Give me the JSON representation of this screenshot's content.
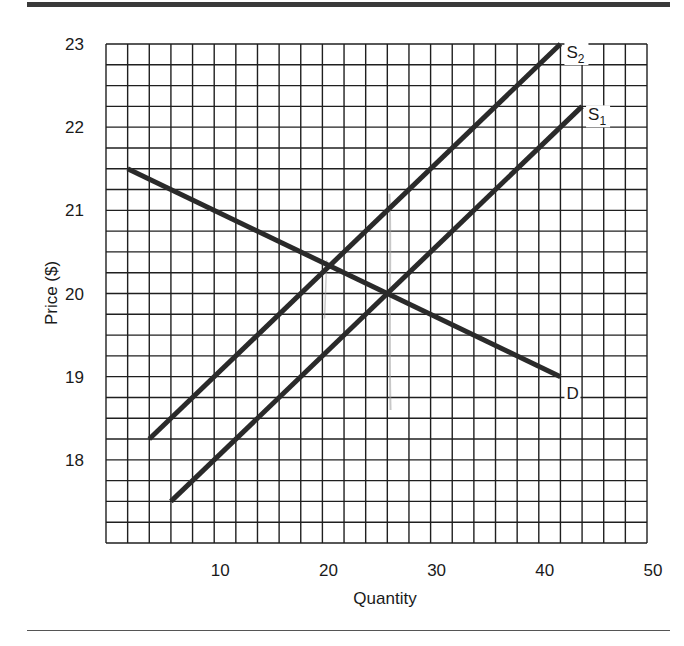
{
  "chart_data": {
    "type": "line",
    "title": "",
    "xlabel": "Quantity",
    "ylabel": "Price ($)",
    "xlim": [
      0,
      50
    ],
    "ylim": [
      17,
      23
    ],
    "x_ticks": [
      10,
      20,
      30,
      40,
      50
    ],
    "y_ticks": [
      18,
      19,
      20,
      21,
      22,
      23
    ],
    "grid": {
      "on": true,
      "x_step": 2,
      "y_step": 0.25
    },
    "legend": "inline labels at line ends",
    "series": [
      {
        "name": "D",
        "label_main": "D",
        "label_sub": "",
        "points": [
          [
            2,
            21.5
          ],
          [
            42,
            19
          ]
        ],
        "color": "#2a2a2a"
      },
      {
        "name": "S1",
        "label_main": "S",
        "label_sub": "1",
        "points": [
          [
            6,
            17.5
          ],
          [
            44,
            22.25
          ]
        ],
        "color": "#2a2a2a"
      },
      {
        "name": "S2",
        "label_main": "S",
        "label_sub": "2",
        "points": [
          [
            4,
            18.25
          ],
          [
            42,
            23
          ]
        ],
        "color": "#2a2a2a"
      }
    ],
    "annotations": [
      {
        "type": "intersection",
        "series": [
          "D",
          "S1"
        ],
        "x": 26,
        "y": 20
      },
      {
        "type": "intersection",
        "series": [
          "D",
          "S2"
        ],
        "x": 20.7,
        "y": 20.33
      }
    ]
  },
  "colors": {
    "grid": "#1f1f1f",
    "line": "#2a2a2a",
    "text": "#1a1a1a",
    "pencil": "#9a9a9a"
  }
}
